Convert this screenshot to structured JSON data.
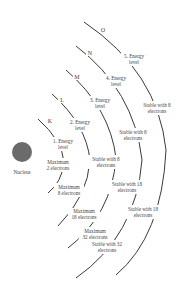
{
  "diagram": {
    "nucleus": {
      "label": "Nucleus",
      "color": "#6b6b6b"
    },
    "shells": [
      {
        "letter": "K",
        "level": "1. Energy",
        "level2": "level",
        "max1": "Maximum",
        "max2": "2 electrons"
      },
      {
        "letter": "L",
        "level": "2. Energy",
        "level2": "level",
        "max1": "Maximum",
        "max2": "8 electrons",
        "stable1": "Stable with 8",
        "stable2": "electrons"
      },
      {
        "letter": "M",
        "level": "3. Energy",
        "level2": "level",
        "max1": "Maximum",
        "max2": "18 electrons",
        "stable1": "Stable with 8",
        "stable2": "electrons",
        "stableB1": "Stable with 18",
        "stableB2": "electrons"
      },
      {
        "letter": "N",
        "level": "4. Energy",
        "level2": "level",
        "max1": "Maximum",
        "max2": "32 electrons",
        "stable1": "Stable with 8",
        "stable2": "electrons",
        "stableB1": "Stable with 18",
        "stableB2": "electrons"
      },
      {
        "letter": "O",
        "level": "5. Energy",
        "level2": "level",
        "stable1": "Stable with 8",
        "stable2": "electrons",
        "stableB1": "Stable with 32",
        "stableB2": "electrons"
      }
    ]
  }
}
